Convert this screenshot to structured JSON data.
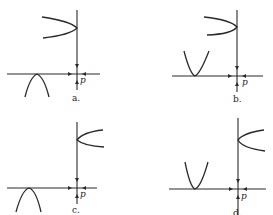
{
  "figure": {
    "panels": [
      {
        "id": "a",
        "label": "a.",
        "point_label": "p",
        "side_curve": "opens-left",
        "lower_curve": "opens-down"
      },
      {
        "id": "b",
        "label": "b.",
        "point_label": "p",
        "side_curve": "opens-left",
        "lower_curve": "opens-up"
      },
      {
        "id": "c",
        "label": "c.",
        "point_label": "p",
        "side_curve": "opens-right",
        "lower_curve": "opens-down"
      },
      {
        "id": "d",
        "label": "d.",
        "point_label": "p",
        "side_curve": "opens-right",
        "lower_curve": "opens-up"
      }
    ],
    "colors": {
      "ink": "#2a2a2a",
      "background": "#ffffff"
    }
  }
}
